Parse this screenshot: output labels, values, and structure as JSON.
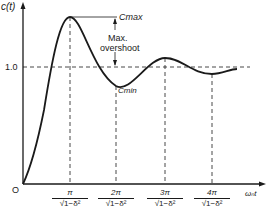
{
  "diagram": {
    "type": "step-response",
    "y_axis_label": "c(t)",
    "x_axis_label": "ωₙt",
    "origin_label": "O",
    "reference_level_label": "1.0",
    "annotations": {
      "cmax": "Cmax",
      "cmin": "Cmin",
      "overshoot_line1": "Max.",
      "overshoot_line2": "overshoot"
    },
    "x_ticks": [
      {
        "num": "π",
        "den": "√1−δ²"
      },
      {
        "num": "2π",
        "den": "√1−δ²"
      },
      {
        "num": "3π",
        "den": "√1−δ²"
      },
      {
        "num": "4π",
        "den": "√1−δ²"
      }
    ],
    "colors": {
      "line": "#1a1a1a",
      "background": "#ffffff"
    }
  }
}
